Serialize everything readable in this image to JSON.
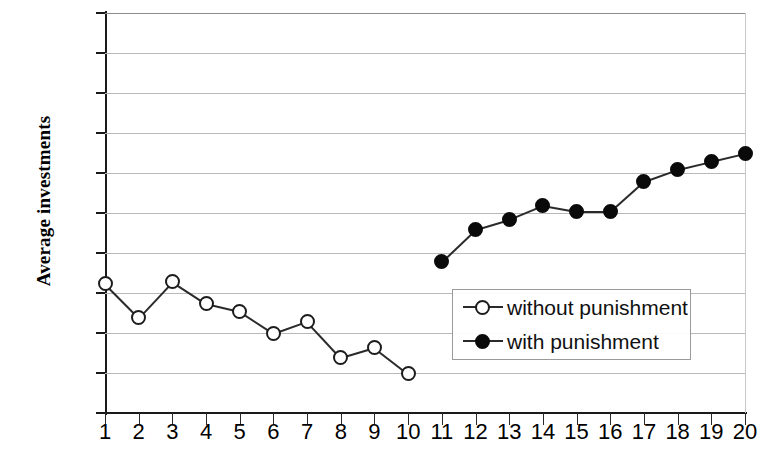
{
  "chart_data": {
    "type": "line",
    "title": "",
    "xlabel": "",
    "ylabel": "Average investments",
    "xlim": [
      1,
      20
    ],
    "ylim": [
      0,
      20
    ],
    "ytick_step": 2,
    "grid": true,
    "legend_position": "center-right",
    "x": [
      1,
      2,
      3,
      4,
      5,
      6,
      7,
      8,
      9,
      10,
      11,
      12,
      13,
      14,
      15,
      16,
      17,
      18,
      19,
      20
    ],
    "xtick_labels": [
      "1",
      "2",
      "3",
      "4",
      "5",
      "6",
      "7",
      "8",
      "9",
      "10",
      "11",
      "12",
      "13",
      "14",
      "15",
      "16",
      "17",
      "18",
      "19",
      "20"
    ],
    "ytick_labels": [
      "0",
      "2",
      "4",
      "6",
      "8",
      "10",
      "12",
      "14",
      "16",
      "18",
      "20"
    ],
    "series": [
      {
        "name": "without punishment",
        "marker": "open-circle",
        "color": "#1c1c1c",
        "x": [
          1,
          2,
          3,
          4,
          5,
          6,
          7,
          8,
          9,
          10
        ],
        "values": [
          6.5,
          4.8,
          6.6,
          5.5,
          5.1,
          4.0,
          4.6,
          2.8,
          3.3,
          2.0
        ]
      },
      {
        "name": "with punishment",
        "marker": "filled-circle",
        "color": "#0a0a0a",
        "x": [
          11,
          12,
          13,
          14,
          15,
          16,
          17,
          18,
          19,
          20
        ],
        "values": [
          7.6,
          9.2,
          9.7,
          10.4,
          10.1,
          10.1,
          11.6,
          12.2,
          12.6,
          13.0
        ]
      }
    ]
  }
}
